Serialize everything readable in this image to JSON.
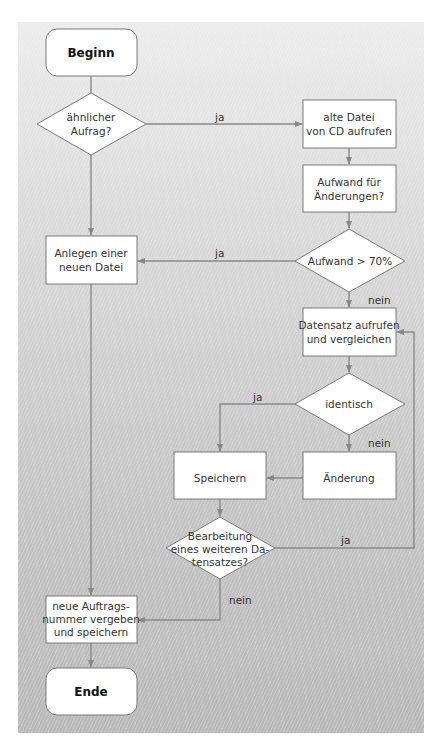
{
  "colors": {
    "line": "#888888",
    "node_fill": "#ffffff",
    "node_stroke": "#7a7a7a",
    "panel_top": "#ececec",
    "panel_bottom": "#b9b9b9",
    "text": "#333333"
  },
  "nodes": {
    "start": {
      "type": "terminal",
      "lines": [
        "Beginn"
      ]
    },
    "similar_order": {
      "type": "decision",
      "lines": [
        "ähnlicher",
        "Aufrag?"
      ]
    },
    "load_old_file": {
      "type": "process",
      "lines": [
        "alte Datei",
        "von CD aufrufen"
      ]
    },
    "effort_changes": {
      "type": "process",
      "lines": [
        "Aufwand für",
        "Änderungen?"
      ]
    },
    "effort_gt_70": {
      "type": "decision",
      "lines": [
        "Aufwand > 70%"
      ]
    },
    "create_new_file": {
      "type": "process",
      "lines": [
        "Anlegen einer",
        "neuen Datei"
      ]
    },
    "load_compare_record": {
      "type": "process",
      "lines": [
        "Datensatz aufrufen",
        "und vergleichen"
      ]
    },
    "identical": {
      "type": "decision",
      "lines": [
        "identisch"
      ]
    },
    "save": {
      "type": "process",
      "lines": [
        "Speichern"
      ]
    },
    "change": {
      "type": "process",
      "lines": [
        "Änderung"
      ]
    },
    "process_another": {
      "type": "decision",
      "lines": [
        "Bearbeitung",
        "eines weiteren Da-",
        "tensatzes?"
      ]
    },
    "new_order_number": {
      "type": "process",
      "lines": [
        "neue Auftrags-",
        "nummer vergeben",
        "und speichern"
      ]
    },
    "end": {
      "type": "terminal",
      "lines": [
        "Ende"
      ]
    }
  },
  "edges": [
    {
      "from": "start",
      "to": "similar_order",
      "label": ""
    },
    {
      "from": "similar_order",
      "to": "load_old_file",
      "label": "ja"
    },
    {
      "from": "similar_order",
      "to": "create_new_file",
      "label": ""
    },
    {
      "from": "load_old_file",
      "to": "effort_changes",
      "label": ""
    },
    {
      "from": "effort_changes",
      "to": "effort_gt_70",
      "label": ""
    },
    {
      "from": "effort_gt_70",
      "to": "create_new_file",
      "label": "ja"
    },
    {
      "from": "effort_gt_70",
      "to": "load_compare_record",
      "label": "nein"
    },
    {
      "from": "load_compare_record",
      "to": "identical",
      "label": ""
    },
    {
      "from": "identical",
      "to": "save",
      "label": "ja"
    },
    {
      "from": "identical",
      "to": "change",
      "label": "nein"
    },
    {
      "from": "change",
      "to": "save",
      "label": ""
    },
    {
      "from": "save",
      "to": "process_another",
      "label": ""
    },
    {
      "from": "process_another",
      "to": "load_compare_record",
      "label": "ja"
    },
    {
      "from": "process_another",
      "to": "new_order_number",
      "label": "nein"
    },
    {
      "from": "create_new_file",
      "to": "new_order_number",
      "label": ""
    },
    {
      "from": "new_order_number",
      "to": "end",
      "label": ""
    }
  ],
  "labels": {
    "ja": "ja",
    "nein": "nein"
  }
}
